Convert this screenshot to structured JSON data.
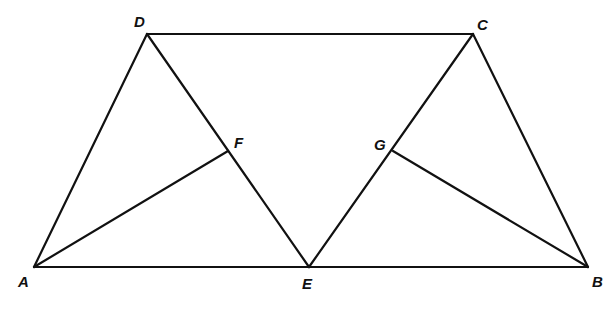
{
  "diagram": {
    "type": "geometry",
    "stroke_color": "#111111",
    "background": "#ffffff",
    "points": {
      "A": {
        "label": "A",
        "x": 34,
        "y": 267,
        "lx": 18,
        "ly": 287
      },
      "B": {
        "label": "B",
        "x": 588,
        "y": 267,
        "lx": 592,
        "ly": 287
      },
      "C": {
        "label": "C",
        "x": 473,
        "y": 34,
        "lx": 477,
        "ly": 30
      },
      "D": {
        "label": "D",
        "x": 147,
        "y": 34,
        "lx": 134,
        "ly": 27
      },
      "E": {
        "label": "E",
        "x": 309,
        "y": 267,
        "lx": 302,
        "ly": 289
      },
      "F": {
        "label": "F",
        "x": 228,
        "y": 151,
        "lx": 234,
        "ly": 148
      },
      "G": {
        "label": "G",
        "x": 393,
        "y": 151,
        "lx": 374,
        "ly": 150
      }
    },
    "segments": [
      [
        "D",
        "C"
      ],
      [
        "A",
        "B"
      ],
      [
        "A",
        "D"
      ],
      [
        "C",
        "B"
      ],
      [
        "D",
        "E"
      ],
      [
        "C",
        "E"
      ],
      [
        "A",
        "F"
      ],
      [
        "B",
        "G"
      ]
    ]
  }
}
